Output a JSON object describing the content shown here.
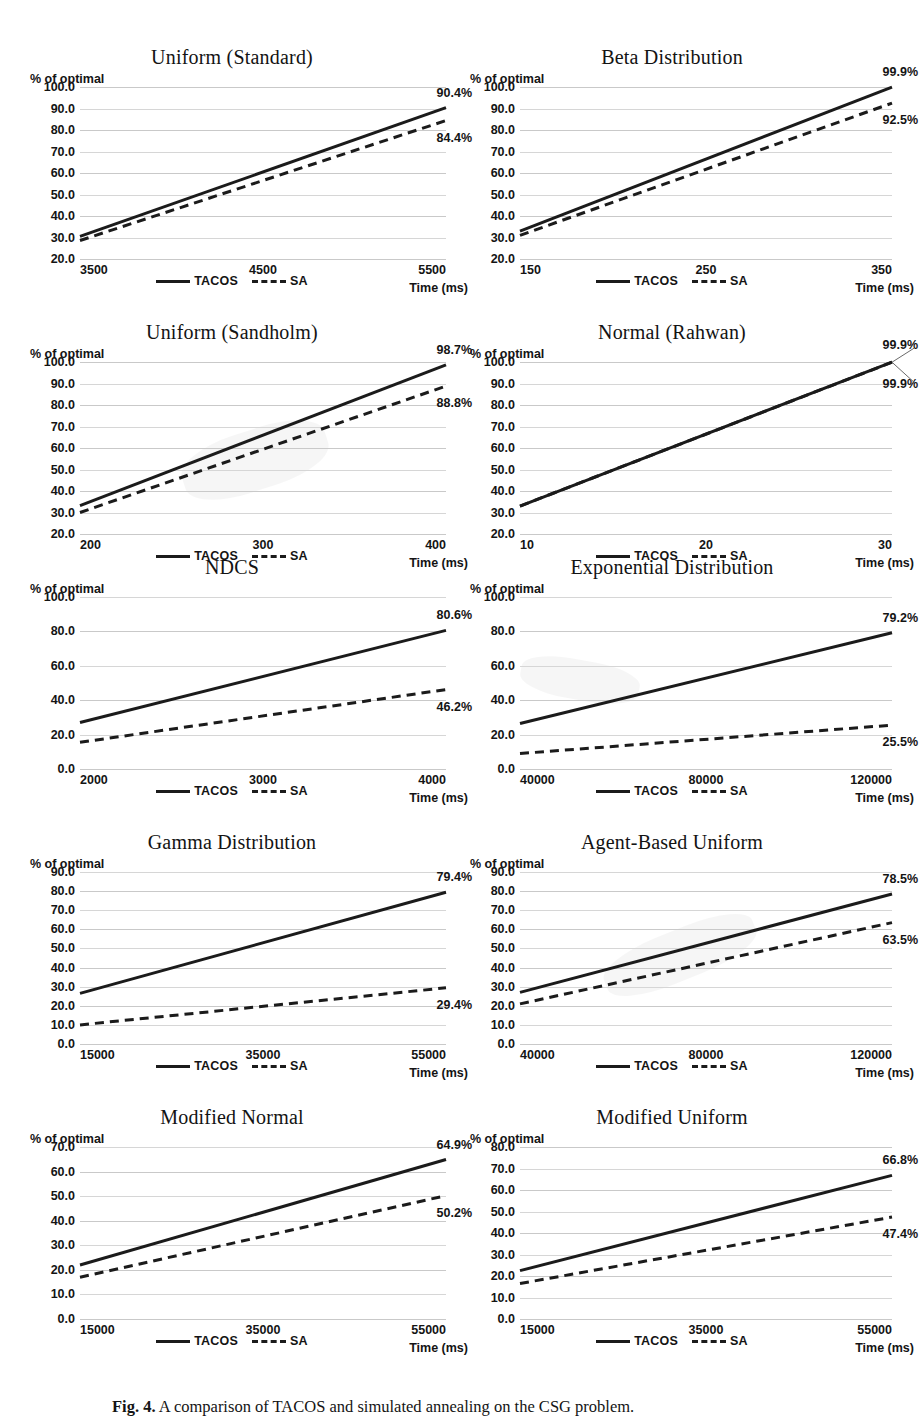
{
  "figure": {
    "caption_prefix": "Fig. 4.",
    "caption_text": "A comparison of TACOS and simulated annealing on the CSG problem.",
    "legend": {
      "tacos_label": "TACOS",
      "sa_label": "SA",
      "tacos_style": "solid",
      "sa_style": "dashed",
      "line_color": "#1b1b1b"
    },
    "axis_captions": {
      "y": "% of optimal",
      "x": "Time (ms)"
    }
  },
  "chart_data": [
    {
      "id": "uniform-standard",
      "type": "line",
      "title": "Uniform (Standard)",
      "xlabel": "Time (ms)",
      "ylabel": "% of optimal",
      "xlim": [
        3500,
        5500
      ],
      "ylim": [
        20.0,
        100.0
      ],
      "xticks": [
        3500,
        4500,
        5500
      ],
      "xtick_labels": [
        "3500",
        "4500",
        "5500"
      ],
      "yticks": [
        20.0,
        30.0,
        40.0,
        50.0,
        60.0,
        70.0,
        80.0,
        90.0,
        100.0
      ],
      "ytick_labels": [
        "20.0",
        "30.0",
        "40.0",
        "50.0",
        "60.0",
        "70.0",
        "80.0",
        "90.0",
        "100.0"
      ],
      "grid": true,
      "legend_position": "bottom",
      "series": [
        {
          "name": "TACOS",
          "x": [
            3500,
            5500
          ],
          "values": [
            30.5,
            90.4
          ],
          "end_label": "90.4%"
        },
        {
          "name": "SA",
          "x": [
            3500,
            5500
          ],
          "values": [
            28.6,
            84.4
          ],
          "end_label": "84.4%"
        }
      ]
    },
    {
      "id": "beta-distribution",
      "type": "line",
      "title": "Beta Distribution",
      "xlabel": "Time (ms)",
      "ylabel": "% of optimal",
      "xlim": [
        150,
        350
      ],
      "ylim": [
        20.0,
        100.0
      ],
      "xticks": [
        150,
        250,
        350
      ],
      "xtick_labels": [
        "150",
        "250",
        "350"
      ],
      "yticks": [
        20.0,
        30.0,
        40.0,
        50.0,
        60.0,
        70.0,
        80.0,
        90.0,
        100.0
      ],
      "ytick_labels": [
        "20.0",
        "30.0",
        "40.0",
        "50.0",
        "60.0",
        "70.0",
        "80.0",
        "90.0",
        "100.0"
      ],
      "grid": true,
      "legend_position": "bottom",
      "series": [
        {
          "name": "TACOS",
          "x": [
            150,
            350
          ],
          "values": [
            33.0,
            99.9
          ],
          "end_label": "99.9%"
        },
        {
          "name": "SA",
          "x": [
            150,
            350
          ],
          "values": [
            31.0,
            92.5
          ],
          "end_label": "92.5%"
        }
      ]
    },
    {
      "id": "uniform-sandholm",
      "type": "line",
      "title": "Uniform (Sandholm)",
      "xlabel": "Time (ms)",
      "ylabel": "% of optimal",
      "xlim": [
        200,
        400
      ],
      "ylim": [
        20.0,
        100.0
      ],
      "xticks": [
        200,
        300,
        400
      ],
      "xtick_labels": [
        "200",
        "300",
        "400"
      ],
      "yticks": [
        20.0,
        30.0,
        40.0,
        50.0,
        60.0,
        70.0,
        80.0,
        90.0,
        100.0
      ],
      "ytick_labels": [
        "20.0",
        "30.0",
        "40.0",
        "50.0",
        "60.0",
        "70.0",
        "80.0",
        "90.0",
        "100.0"
      ],
      "grid": true,
      "legend_position": "bottom",
      "series": [
        {
          "name": "TACOS",
          "x": [
            200,
            400
          ],
          "values": [
            33.2,
            98.7
          ],
          "end_label": "98.7%"
        },
        {
          "name": "SA",
          "x": [
            200,
            400
          ],
          "values": [
            30.0,
            88.8
          ],
          "end_label": "88.8%"
        }
      ]
    },
    {
      "id": "normal-rahwan",
      "type": "line",
      "title": "Normal (Rahwan)",
      "xlabel": "Time (ms)",
      "ylabel": "% of optimal",
      "xlim": [
        10,
        30
      ],
      "ylim": [
        20.0,
        100.0
      ],
      "xticks": [
        10,
        20,
        30
      ],
      "xtick_labels": [
        "10",
        "20",
        "30"
      ],
      "yticks": [
        20.0,
        30.0,
        40.0,
        50.0,
        60.0,
        70.0,
        80.0,
        90.0,
        100.0
      ],
      "ytick_labels": [
        "20.0",
        "30.0",
        "40.0",
        "50.0",
        "60.0",
        "70.0",
        "80.0",
        "90.0",
        "100.0"
      ],
      "grid": true,
      "legend_position": "bottom",
      "note": "TACOS and SA overlap exactly",
      "series": [
        {
          "name": "TACOS",
          "x": [
            10,
            30
          ],
          "values": [
            33.0,
            99.9
          ],
          "end_label": "99.9%"
        },
        {
          "name": "SA",
          "x": [
            10,
            30
          ],
          "values": [
            33.0,
            99.9
          ],
          "end_label": "99.9%"
        }
      ]
    },
    {
      "id": "ndcs",
      "type": "line",
      "title": "NDCS",
      "xlabel": "Time (ms)",
      "ylabel": "% of optimal",
      "xlim": [
        2000,
        4000
      ],
      "ylim": [
        0.0,
        100.0
      ],
      "xticks": [
        2000,
        3000,
        4000
      ],
      "xtick_labels": [
        "2000",
        "3000",
        "4000"
      ],
      "yticks": [
        0.0,
        20.0,
        40.0,
        60.0,
        80.0,
        100.0
      ],
      "ytick_labels": [
        "0.0",
        "20.0",
        "40.0",
        "60.0",
        "80.0",
        "100.0"
      ],
      "grid": true,
      "legend_position": "bottom",
      "series": [
        {
          "name": "TACOS",
          "x": [
            2000,
            4000
          ],
          "values": [
            27.0,
            80.6
          ],
          "end_label": "80.6%"
        },
        {
          "name": "SA",
          "x": [
            2000,
            4000
          ],
          "values": [
            15.5,
            46.2
          ],
          "end_label": "46.2%"
        }
      ]
    },
    {
      "id": "exponential-distribution",
      "type": "line",
      "title": "Exponential Distribution",
      "xlabel": "Time (ms)",
      "ylabel": "% of optimal",
      "xlim": [
        40000,
        120000
      ],
      "ylim": [
        0.0,
        100.0
      ],
      "xticks": [
        40000,
        80000,
        120000
      ],
      "xtick_labels": [
        "40000",
        "80000",
        "120000"
      ],
      "yticks": [
        0.0,
        20.0,
        40.0,
        60.0,
        80.0,
        100.0
      ],
      "ytick_labels": [
        "0.0",
        "20.0",
        "40.0",
        "60.0",
        "80.0",
        "100.0"
      ],
      "grid": true,
      "legend_position": "bottom",
      "series": [
        {
          "name": "TACOS",
          "x": [
            40000,
            120000
          ],
          "values": [
            26.5,
            79.2
          ],
          "end_label": "79.2%"
        },
        {
          "name": "SA",
          "x": [
            40000,
            120000
          ],
          "values": [
            9.0,
            25.5
          ],
          "end_label": "25.5%"
        }
      ]
    },
    {
      "id": "gamma-distribution",
      "type": "line",
      "title": "Gamma Distribution",
      "xlabel": "Time (ms)",
      "ylabel": "% of optimal",
      "xlim": [
        15000,
        55000
      ],
      "ylim": [
        0.0,
        90.0
      ],
      "xticks": [
        15000,
        35000,
        55000
      ],
      "xtick_labels": [
        "15000",
        "35000",
        "55000"
      ],
      "yticks": [
        0.0,
        10.0,
        20.0,
        30.0,
        40.0,
        50.0,
        60.0,
        70.0,
        80.0,
        90.0
      ],
      "ytick_labels": [
        "0.0",
        "10.0",
        "20.0",
        "30.0",
        "40.0",
        "50.0",
        "60.0",
        "70.0",
        "80.0",
        "90.0"
      ],
      "grid": true,
      "legend_position": "bottom",
      "series": [
        {
          "name": "TACOS",
          "x": [
            15000,
            55000
          ],
          "values": [
            26.5,
            79.4
          ],
          "end_label": "79.4%"
        },
        {
          "name": "SA",
          "x": [
            15000,
            55000
          ],
          "values": [
            10.0,
            29.4
          ],
          "end_label": "29.4%"
        }
      ]
    },
    {
      "id": "agent-based-uniform",
      "type": "line",
      "title": "Agent-Based Uniform",
      "xlabel": "Time (ms)",
      "ylabel": "% of optimal",
      "xlim": [
        40000,
        120000
      ],
      "ylim": [
        0.0,
        90.0
      ],
      "xticks": [
        40000,
        80000,
        120000
      ],
      "xtick_labels": [
        "40000",
        "80000",
        "120000"
      ],
      "yticks": [
        0.0,
        10.0,
        20.0,
        30.0,
        40.0,
        50.0,
        60.0,
        70.0,
        80.0,
        90.0
      ],
      "ytick_labels": [
        "0.0",
        "10.0",
        "20.0",
        "30.0",
        "40.0",
        "50.0",
        "60.0",
        "70.0",
        "80.0",
        "90.0"
      ],
      "grid": true,
      "legend_position": "bottom",
      "series": [
        {
          "name": "TACOS",
          "x": [
            40000,
            120000
          ],
          "values": [
            27.0,
            78.5
          ],
          "end_label": "78.5%"
        },
        {
          "name": "SA",
          "x": [
            40000,
            120000
          ],
          "values": [
            21.0,
            63.5
          ],
          "end_label": "63.5%"
        }
      ]
    },
    {
      "id": "modified-normal",
      "type": "line",
      "title": "Modified Normal",
      "xlabel": "Time (ms)",
      "ylabel": "% of optimal",
      "xlim": [
        15000,
        55000
      ],
      "ylim": [
        0.0,
        70.0
      ],
      "xticks": [
        15000,
        35000,
        55000
      ],
      "xtick_labels": [
        "15000",
        "35000",
        "55000"
      ],
      "yticks": [
        0.0,
        10.0,
        20.0,
        30.0,
        40.0,
        50.0,
        60.0,
        70.0
      ],
      "ytick_labels": [
        "0.0",
        "10.0",
        "20.0",
        "30.0",
        "40.0",
        "50.0",
        "60.0",
        "70.0"
      ],
      "grid": true,
      "legend_position": "bottom",
      "series": [
        {
          "name": "TACOS",
          "x": [
            15000,
            55000
          ],
          "values": [
            22.0,
            64.9
          ],
          "end_label": "64.9%"
        },
        {
          "name": "SA",
          "x": [
            15000,
            55000
          ],
          "values": [
            17.0,
            50.2
          ],
          "end_label": "50.2%"
        }
      ]
    },
    {
      "id": "modified-uniform",
      "type": "line",
      "title": "Modified Uniform",
      "xlabel": "Time (ms)",
      "ylabel": "% of optimal",
      "xlim": [
        15000,
        55000
      ],
      "ylim": [
        0.0,
        80.0
      ],
      "xticks": [
        15000,
        35000,
        55000
      ],
      "xtick_labels": [
        "15000",
        "35000",
        "55000"
      ],
      "yticks": [
        0.0,
        10.0,
        20.0,
        30.0,
        40.0,
        50.0,
        60.0,
        70.0,
        80.0
      ],
      "ytick_labels": [
        "0.0",
        "10.0",
        "20.0",
        "30.0",
        "40.0",
        "50.0",
        "60.0",
        "70.0",
        "80.0"
      ],
      "grid": true,
      "legend_position": "bottom",
      "series": [
        {
          "name": "TACOS",
          "x": [
            15000,
            55000
          ],
          "values": [
            22.5,
            66.8
          ],
          "end_label": "66.8%"
        },
        {
          "name": "SA",
          "x": [
            15000,
            55000
          ],
          "values": [
            16.5,
            47.4
          ],
          "end_label": "47.4%"
        }
      ]
    }
  ]
}
